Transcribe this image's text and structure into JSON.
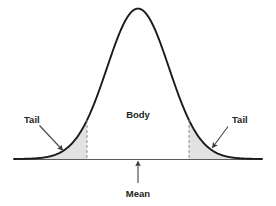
{
  "figure": {
    "title": "",
    "background_color": "#ffffff",
    "curve_color": "#1a1a1a",
    "shade_color": "#e2e2e2",
    "axis_color": "#555555",
    "arrow_color": "#444444",
    "text_color": "#231f20"
  },
  "labels": {
    "tail_left": "Tail",
    "tail_right": "Tail",
    "body": "Body",
    "mean": "Mean"
  },
  "icons": {
    "tail_left_arrow": "arrow-down-right-icon",
    "tail_right_arrow": "arrow-down-left-icon",
    "mean_arrow": "arrow-up-icon",
    "left_cutoff_dashed": "dashed-vertical-line-icon",
    "right_cutoff_dashed": "dashed-vertical-line-icon"
  },
  "chart_data": {
    "type": "area",
    "title": "",
    "subtitle": "",
    "xlabel": "",
    "ylabel": "",
    "grid": false,
    "legend_position": "none",
    "distribution": "normal",
    "mean": 0,
    "sd": 1,
    "xlim": [
      -4,
      4
    ],
    "ylim": [
      0,
      1
    ],
    "annotations": [
      {
        "text": "Tail",
        "region": "left-tail",
        "x": -2.45,
        "y": 0.33
      },
      {
        "text": "Body",
        "region": "center",
        "x": 0,
        "y": 0.27
      },
      {
        "text": "Tail",
        "region": "right-tail",
        "x": 2.45,
        "y": 0.33
      },
      {
        "text": "Mean",
        "region": "baseline",
        "x": 0,
        "y": -0.22
      }
    ],
    "shaded_regions": [
      {
        "name": "left-tail",
        "from": -4,
        "to": -1.645,
        "fill": "#e2e2e2"
      },
      {
        "name": "right-tail",
        "from": 1.645,
        "to": 4,
        "fill": "#e2e2e2"
      }
    ],
    "cutoffs": [
      -1.645,
      1.645
    ],
    "x": [
      -4,
      -3.75,
      -3.5,
      -3.25,
      -3,
      -2.75,
      -2.5,
      -2.25,
      -2,
      -1.75,
      -1.5,
      -1.25,
      -1,
      -0.75,
      -0.5,
      -0.25,
      0,
      0.25,
      0.5,
      0.75,
      1,
      1.25,
      1.5,
      1.75,
      2,
      2.25,
      2.5,
      2.75,
      3,
      3.25,
      3.5,
      3.75,
      4
    ],
    "y": [
      0.0003,
      0.0009,
      0.0022,
      0.0051,
      0.0111,
      0.0228,
      0.0439,
      0.079,
      0.1353,
      0.2163,
      0.3247,
      0.4578,
      0.6065,
      0.7548,
      0.8825,
      0.9692,
      1.0,
      0.9692,
      0.8825,
      0.7548,
      0.6065,
      0.4578,
      0.3247,
      0.2163,
      0.1353,
      0.079,
      0.0439,
      0.0228,
      0.0111,
      0.0051,
      0.0022,
      0.0009,
      0.0003
    ]
  }
}
